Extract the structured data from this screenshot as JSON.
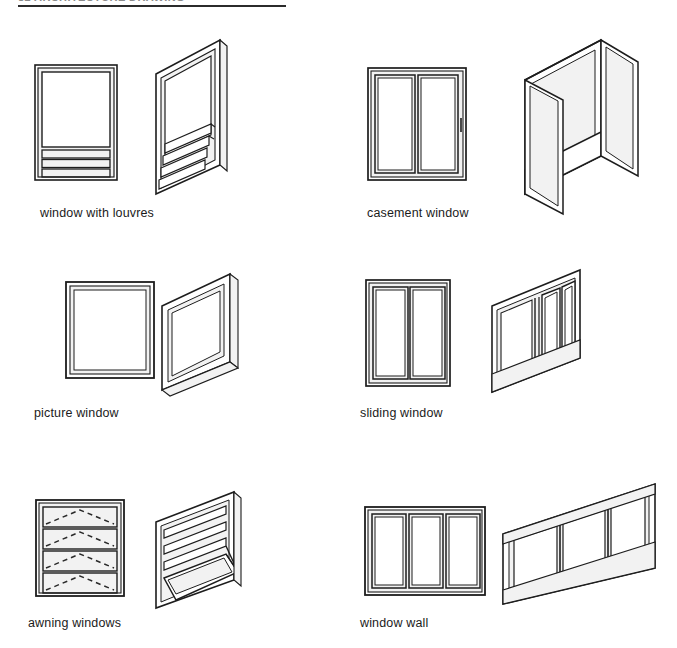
{
  "header": {
    "text": "82  ARCHITECTURE DRAWING",
    "rule_color": "#2b2b2b"
  },
  "style": {
    "line_color": "#1d1d1d",
    "background": "#ffffff",
    "caption_color": "#1b1b1b",
    "hinge_indicator_color": "#2a2a2a"
  },
  "figures": [
    {
      "id": "window-with-louvres",
      "caption": "window with louvres",
      "elevation": "fixed upper pane over three horizontal louvre slats",
      "perspective": "angled view with louvre slats swung open outward",
      "panels": 1,
      "louvre_slats": 3
    },
    {
      "id": "casement-window",
      "caption": "casement window",
      "elevation": "two vertical sashes side by side",
      "perspective": "both sashes swung open outward on side hinges",
      "panels": 2
    },
    {
      "id": "picture-window",
      "caption": "picture window",
      "elevation": "single fixed square pane, no divisions",
      "perspective": "single fixed pane shown at an angle",
      "panels": 1
    },
    {
      "id": "sliding-window",
      "caption": "sliding window",
      "elevation": "two vertical sashes in a frame",
      "perspective": "sashes overlapping on parallel tracks",
      "panels": 2
    },
    {
      "id": "awning-windows",
      "caption": "awning windows",
      "elevation": "four stacked horizontal sashes with dashed top-hinge indicators",
      "perspective": "stacked sashes with the lower sash projected outward",
      "panels": 4,
      "hinge_symbol": "dashed V with apex at top centre"
    },
    {
      "id": "window-wall",
      "caption": "window wall",
      "elevation": "three tall vertical panels in a wide frame",
      "perspective": "three-panel wall viewed at an angle",
      "panels": 3
    }
  ]
}
